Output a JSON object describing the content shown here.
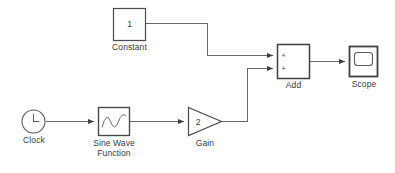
{
  "diagram": {
    "type": "simulink-block-diagram",
    "background_color": "#ffffff",
    "line_color": "#5a5a5a",
    "block_border_color": "#4a4a4a",
    "label_color": "#3a3a3a",
    "blocks": [
      {
        "id": "constant",
        "name": "Constant",
        "label": "Constant",
        "value": "1",
        "shape": "rectangle",
        "x": 113,
        "y": 8,
        "w": 32,
        "h": 32
      },
      {
        "id": "clock",
        "name": "Clock",
        "label": "Clock",
        "value": "",
        "shape": "circle",
        "x": 22,
        "y": 110,
        "w": 23,
        "h": 23
      },
      {
        "id": "sine_wave_function",
        "name": "Sine Wave Function",
        "label": "Sine Wave\nFunction",
        "value": "",
        "shape": "rectangle-sine",
        "x": 98,
        "y": 107,
        "w": 32,
        "h": 29
      },
      {
        "id": "gain",
        "name": "Gain",
        "label": "Gain",
        "value": "2",
        "shape": "triangle",
        "x": 188,
        "y": 107,
        "w": 34,
        "h": 29
      },
      {
        "id": "add",
        "name": "Add",
        "label": "Add",
        "value": "",
        "shape": "rectangle",
        "port_signs": [
          "+",
          "+"
        ],
        "x": 277,
        "y": 44,
        "w": 33,
        "h": 34
      },
      {
        "id": "scope",
        "name": "Scope",
        "label": "Scope",
        "value": "",
        "shape": "scope",
        "x": 349,
        "y": 46,
        "w": 29,
        "h": 31
      }
    ],
    "signals": [
      {
        "id": "constant-to-add",
        "from": "constant",
        "to": "add",
        "to_port": 1
      },
      {
        "id": "clock-to-sine",
        "from": "clock",
        "to": "sine_wave_function"
      },
      {
        "id": "sine-to-gain",
        "from": "sine_wave_function",
        "to": "gain"
      },
      {
        "id": "gain-to-add",
        "from": "gain",
        "to": "add",
        "to_port": 2
      },
      {
        "id": "add-to-scope",
        "from": "add",
        "to": "scope"
      }
    ]
  }
}
